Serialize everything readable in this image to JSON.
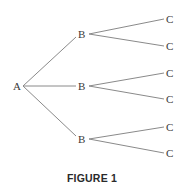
{
  "diagram": {
    "type": "tree",
    "caption": "FIGURE 1",
    "colors": {
      "edge": "#8a8a8a",
      "label": "#3a3a3a",
      "caption": "#2a2a2a"
    },
    "root": {
      "label": "A",
      "x": 17,
      "y": 86
    },
    "level1": [
      {
        "label": "B",
        "x": 82,
        "y": 34
      },
      {
        "label": "B",
        "x": 82,
        "y": 86
      },
      {
        "label": "B",
        "x": 82,
        "y": 139
      }
    ],
    "level2": [
      {
        "label": "C",
        "parent": 0,
        "x": 170,
        "y": 19
      },
      {
        "label": "C",
        "parent": 0,
        "x": 170,
        "y": 46
      },
      {
        "label": "C",
        "parent": 1,
        "x": 170,
        "y": 73
      },
      {
        "label": "C",
        "parent": 1,
        "x": 170,
        "y": 99
      },
      {
        "label": "C",
        "parent": 2,
        "x": 170,
        "y": 127
      },
      {
        "label": "C",
        "parent": 2,
        "x": 170,
        "y": 153
      }
    ]
  }
}
